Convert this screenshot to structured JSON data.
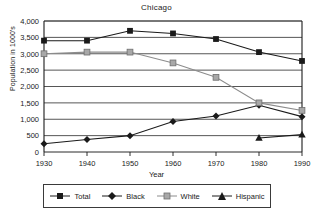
{
  "chart_data": {
    "type": "line",
    "title": "Chicago",
    "xlabel": "Year",
    "ylabel": "Population in 1000's",
    "x": [
      1930,
      1940,
      1950,
      1960,
      1970,
      1980,
      1990
    ],
    "xtick_labels": [
      "1930",
      "1940",
      "1950",
      "1960",
      "1970",
      "1980",
      "1990"
    ],
    "ytick_labels": [
      "0",
      "500",
      "1,000",
      "1,500",
      "2,000",
      "2,500",
      "3,000",
      "3,500",
      "4,000"
    ],
    "ytick_values": [
      0,
      500,
      1000,
      1500,
      2000,
      2500,
      3000,
      3500,
      4000
    ],
    "ylim": [
      0,
      4000
    ],
    "xlim": [
      1930,
      1990
    ],
    "grid": "horizontal",
    "legend_position": "bottom",
    "series": [
      {
        "name": "Total",
        "marker": "square",
        "color": "#1a1a1a",
        "values": [
          3400,
          3400,
          3700,
          3620,
          3450,
          3050,
          2780
        ]
      },
      {
        "name": "Black",
        "marker": "diamond",
        "color": "#1a1a1a",
        "values": [
          250,
          380,
          500,
          930,
          1100,
          1430,
          1080
        ]
      },
      {
        "name": "White",
        "marker": "circle",
        "color": "#8c8c8c",
        "values": [
          3000,
          3050,
          3050,
          2720,
          2280,
          1500,
          1270
        ]
      },
      {
        "name": "Hispanic",
        "marker": "triangle",
        "color": "#1a1a1a",
        "values": [
          null,
          null,
          null,
          null,
          null,
          430,
          530
        ]
      }
    ]
  },
  "legend": {
    "items": [
      {
        "label": "Total"
      },
      {
        "label": "Black"
      },
      {
        "label": "White"
      },
      {
        "label": "Hispanic"
      }
    ]
  }
}
